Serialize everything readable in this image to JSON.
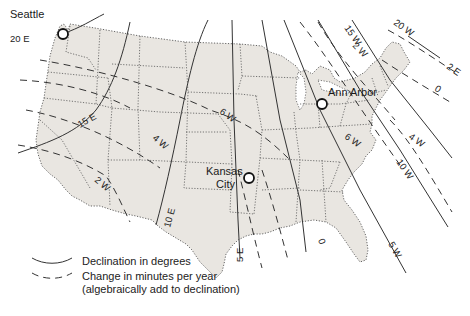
{
  "map": {
    "title": "Magnetic declination map of the contiguous United States",
    "region": "Contiguous United States",
    "colors": {
      "land": "#e9e6e1",
      "lines": "#333333",
      "background": "#ffffff"
    },
    "cities": [
      {
        "name": "Seattle",
        "label": "Seattle"
      },
      {
        "name": "Kansas City",
        "label_line1": "Kansas",
        "label_line2": "City"
      },
      {
        "name": "Ann Arbor",
        "label": "Ann Arbor"
      }
    ],
    "declination_lines": [
      {
        "label": "20 E"
      },
      {
        "label": "15 E"
      },
      {
        "label": "10 E"
      },
      {
        "label": "5 E"
      },
      {
        "label": "0"
      },
      {
        "label": "5 W"
      },
      {
        "label": "10 W"
      },
      {
        "label": "15 W"
      },
      {
        "label": "20 W"
      }
    ],
    "annual_change_lines": [
      {
        "label": "2 W"
      },
      {
        "label": "4 W"
      },
      {
        "label": "6 W"
      },
      {
        "label": "2 W"
      },
      {
        "label": "4 W"
      },
      {
        "label": "6 W"
      },
      {
        "label": "0"
      },
      {
        "label": "2 E"
      }
    ]
  },
  "legend": {
    "declination": "Declination in degrees",
    "change_line1": "Change in minutes per year",
    "change_line2": "(algebraically add to declination)"
  }
}
